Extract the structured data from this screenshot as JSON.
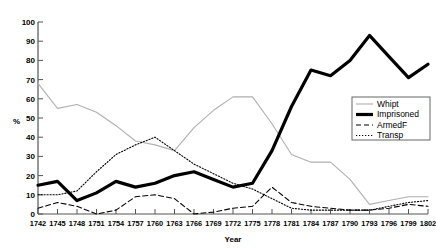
{
  "chart_data": {
    "type": "line",
    "title": "",
    "xlabel": "Year",
    "ylabel": "%",
    "xlim": [
      1742,
      1802
    ],
    "ylim": [
      0,
      100
    ],
    "grid": false,
    "legend_position": "right-middle",
    "x_tick_labels": [
      "1742",
      "1745",
      "1748",
      "1751",
      "1754",
      "1757",
      "1760",
      "1763",
      "1766",
      "1769",
      "1772",
      "1775",
      "1778",
      "1781",
      "1784",
      "1787",
      "1790",
      "1793",
      "1796",
      "1799",
      "1802"
    ],
    "y_tick_labels": [
      "0",
      "10",
      "20",
      "30",
      "40",
      "50",
      "60",
      "70",
      "80",
      "90",
      "100"
    ],
    "y_ticks": [
      0,
      10,
      20,
      30,
      40,
      50,
      60,
      70,
      80,
      90,
      100
    ],
    "x": [
      1742,
      1745,
      1748,
      1751,
      1754,
      1757,
      1760,
      1763,
      1766,
      1769,
      1772,
      1775,
      1778,
      1781,
      1784,
      1787,
      1790,
      1793,
      1796,
      1799,
      1802
    ],
    "series": [
      {
        "name": "Whipt",
        "style": "thin-solid-gray",
        "color": "#b0b0b0",
        "width": 1.1,
        "values": [
          68,
          55,
          57,
          53,
          46,
          38,
          36,
          33,
          45,
          54,
          61,
          61,
          47,
          31,
          27,
          27,
          18,
          5,
          7,
          9,
          9
        ]
      },
      {
        "name": "Imprisoned",
        "style": "thick-solid-black",
        "color": "#000000",
        "width": 3.2,
        "values": [
          15,
          17,
          7,
          11,
          17,
          14,
          16,
          20,
          22,
          18,
          14,
          16,
          33,
          56,
          75,
          72,
          80,
          93,
          82,
          71,
          78
        ]
      },
      {
        "name": "ArmedF",
        "style": "dashed",
        "color": "#000000",
        "width": 1.1,
        "values": [
          3,
          6,
          4,
          0,
          2,
          9,
          10,
          8,
          0,
          1,
          3,
          4,
          14,
          6,
          4,
          3,
          2,
          2,
          3,
          5,
          4
        ]
      },
      {
        "name": "Transp",
        "style": "dotted",
        "color": "#000000",
        "width": 1.1,
        "values": [
          10,
          10,
          12,
          22,
          31,
          36,
          40,
          33,
          26,
          21,
          16,
          13,
          8,
          3,
          2,
          2,
          2,
          2,
          4,
          6,
          7
        ]
      }
    ]
  },
  "legend": {
    "items": [
      {
        "label": "Whipt"
      },
      {
        "label": "Imprisoned"
      },
      {
        "label": "ArmedF"
      },
      {
        "label": "Transp"
      }
    ]
  }
}
